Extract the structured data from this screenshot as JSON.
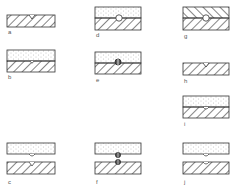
{
  "diagram": {
    "type": "cross-section panels of joined layers (hatched substrate, dotted coating) with grooves and circular inclusions",
    "colors": {
      "stroke": "#333333",
      "hatch": "#444444",
      "dots": "#888888",
      "label": "#555555",
      "background": "#ffffff"
    },
    "panels": [
      {
        "id": "a",
        "label": "a",
        "layers": [
          "hatched"
        ],
        "feature": "v-groove on top surface"
      },
      {
        "id": "b",
        "label": "b",
        "layers": [
          "dotted",
          "hatched"
        ],
        "feature": "small groove at interface"
      },
      {
        "id": "c",
        "label": "c",
        "layers": [
          "dotted",
          "hatched"
        ],
        "separated": true,
        "feature": "matching notches at facing surfaces"
      },
      {
        "id": "d",
        "label": "d",
        "layers": [
          "dotted",
          "hatched"
        ],
        "feature": "hollow circle at interface"
      },
      {
        "id": "e",
        "label": "e",
        "layers": [
          "dotted",
          "hatched"
        ],
        "feature": "filled/split circle at interface"
      },
      {
        "id": "f",
        "label": "f",
        "layers": [
          "dotted",
          "hatched"
        ],
        "separated": true,
        "feature": "filled circles on both facing surfaces"
      },
      {
        "id": "g",
        "label": "g",
        "layers": [
          "hatched-reverse",
          "hatched"
        ],
        "feature": "hollow circle at interface (chevron hatching)"
      },
      {
        "id": "h",
        "label": "h",
        "layers": [
          "hatched"
        ],
        "feature": "v-groove on top surface"
      },
      {
        "id": "i",
        "label": "i",
        "layers": [
          "dotted",
          "hatched"
        ],
        "feature": "small bump at interface"
      },
      {
        "id": "j",
        "label": "j",
        "layers": [
          "dotted",
          "hatched"
        ],
        "separated": true,
        "feature": "bump on top piece, notch on bottom piece"
      }
    ]
  }
}
